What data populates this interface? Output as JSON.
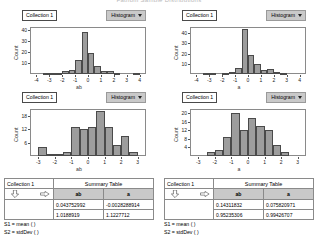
{
  "clipped_title": "Fathom Sample Distributions",
  "panels": [
    {
      "id": "top-left",
      "collection_label": "Collection 1",
      "plot_menu_label": "Histogram",
      "chart_data": {
        "type": "bar",
        "title": "",
        "xlabel": "ab",
        "ylabel": "Count",
        "ylim": [
          0,
          43
        ],
        "xlim": [
          -4.5,
          4.5
        ],
        "yticks": [
          10,
          20,
          30,
          40
        ],
        "xticks": [
          -4,
          -3,
          -2,
          -1,
          0,
          1,
          2,
          3,
          4
        ],
        "grid": false,
        "bin_centers": [
          -3.75,
          -3.25,
          -2.75,
          -2.25,
          -1.75,
          -1.25,
          -0.75,
          -0.25,
          0.25,
          0.75,
          1.25,
          1.75,
          2.25,
          2.75,
          3.25,
          3.75
        ],
        "values": [
          0,
          1,
          1,
          1,
          3,
          4,
          13,
          38,
          19,
          7,
          3,
          3,
          1,
          0,
          0,
          1
        ]
      }
    },
    {
      "id": "top-right",
      "collection_label": "Collection 1",
      "plot_menu_label": "Histogram",
      "chart_data": {
        "type": "bar",
        "title": "",
        "xlabel": "a",
        "ylabel": "Count",
        "ylim": [
          0,
          46
        ],
        "xlim": [
          -4.5,
          4.5
        ],
        "yticks": [
          10,
          20,
          30,
          40
        ],
        "xticks": [
          -4,
          -3,
          -2,
          -1,
          0,
          1,
          2,
          3,
          4
        ],
        "grid": false,
        "bin_centers": [
          -3.75,
          -3.25,
          -2.75,
          -2.25,
          -1.75,
          -1.25,
          -0.75,
          -0.25,
          0.25,
          0.75,
          1.25,
          1.75,
          2.25,
          2.75,
          3.25,
          3.75
        ],
        "values": [
          0,
          1,
          1,
          0,
          1,
          2,
          6,
          44,
          19,
          10,
          4,
          5,
          2,
          1,
          0,
          0
        ]
      }
    },
    {
      "id": "bottom-left",
      "collection_label": "Collection 1",
      "plot_menu_label": "Histogram",
      "chart_data": {
        "type": "bar",
        "title": "",
        "xlabel": "ab",
        "ylabel": "Count",
        "ylim": [
          0,
          21
        ],
        "xlim": [
          -3.5,
          3.5
        ],
        "yticks": [
          6,
          12,
          18
        ],
        "xticks": [
          -3,
          -2,
          -1,
          0,
          1,
          2,
          3
        ],
        "grid": false,
        "bin_centers": [
          -3.25,
          -2.75,
          -2.25,
          -1.75,
          -1.25,
          -0.75,
          -0.25,
          0.25,
          0.75,
          1.25,
          1.75,
          2.25,
          2.75
        ],
        "values": [
          0,
          4,
          1,
          1,
          2,
          13,
          12,
          13,
          20,
          13,
          5,
          9,
          2
        ]
      }
    },
    {
      "id": "bottom-right",
      "collection_label": "Collection 1",
      "plot_menu_label": "Histogram",
      "chart_data": {
        "type": "bar",
        "title": "",
        "xlabel": "a",
        "ylabel": "Count",
        "ylim": [
          0,
          22
        ],
        "xlim": [
          -3.5,
          3.5
        ],
        "yticks": [
          4,
          8,
          12,
          16,
          20
        ],
        "xticks": [
          -3,
          -2,
          -1,
          0,
          1,
          2,
          3
        ],
        "grid": false,
        "bin_centers": [
          -2.75,
          -2.25,
          -1.75,
          -1.25,
          -0.75,
          -0.25,
          0.25,
          0.75,
          1.25,
          1.75,
          2.25,
          2.75
        ],
        "values": [
          0,
          2,
          3,
          9,
          20,
          12,
          18,
          14,
          12,
          5,
          2,
          0
        ]
      }
    }
  ],
  "tables": [
    {
      "id": "summary-left",
      "collection_label": "Collection 1",
      "summary_label": "Summary Table",
      "columns": [
        "ab",
        "a"
      ],
      "rows": [
        [
          "0.043752992",
          "-0.0028288914"
        ],
        [
          "1.0188919",
          "1.1227712"
        ]
      ],
      "formulas": [
        "S1 = mean ( )",
        "S2 = stdDev ( )"
      ]
    },
    {
      "id": "summary-right",
      "collection_label": "Collection 1",
      "summary_label": "Summary Table",
      "columns": [
        "ab",
        "a"
      ],
      "rows": [
        [
          "0.14311832",
          "0.075820971"
        ],
        [
          "0.95235306",
          "0.99426707"
        ]
      ],
      "formulas": [
        "S1 = mean ( )",
        "S2 = stdDev ( )"
      ]
    }
  ],
  "icons": {
    "caret": "chevron-down-icon",
    "arrow_down": "arrow-down-icon",
    "arrow_right": "arrow-right-icon"
  }
}
